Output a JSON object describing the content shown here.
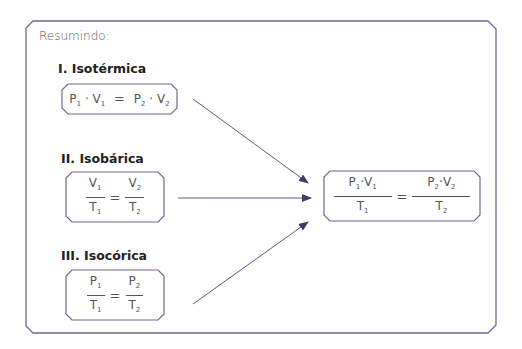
{
  "title": "Resumindo:",
  "colors": {
    "frame": "#5b5b85",
    "arrow": "#3d3d66",
    "text": "#555555"
  },
  "laws": [
    {
      "label": "I. Isotérmica",
      "formula": "P₁ · V₁ = P₂ · V₂",
      "left": "P",
      "left_sub": "1",
      "left2": "V",
      "left2_sub": "1",
      "right": "P",
      "right_sub": "2",
      "right2": "V",
      "right2_sub": "2"
    },
    {
      "label": "II. Isobárica",
      "formula": "V₁/T₁ = V₂/T₂",
      "num1": "V",
      "num1_sub": "1",
      "den1": "T",
      "den1_sub": "1",
      "num2": "V",
      "num2_sub": "2",
      "den2": "T",
      "den2_sub": "2"
    },
    {
      "label": "III. Isocórica",
      "formula": "P₁/T₁ = P₂/T₂",
      "num1": "P",
      "num1_sub": "1",
      "den1": "T",
      "den1_sub": "1",
      "num2": "P",
      "num2_sub": "2",
      "den2": "T",
      "den2_sub": "2"
    }
  ],
  "combined": {
    "formula": "P₁·V₁/T₁ = P₂·V₂/T₂",
    "num1": "P",
    "num1_sub": "1",
    "num1b": "V",
    "num1b_sub": "1",
    "den1": "T",
    "den1_sub": "1",
    "num2": "P",
    "num2_sub": "2",
    "num2b": "V",
    "num2b_sub": "2",
    "den2": "T",
    "den2_sub": "2"
  },
  "operators": {
    "equals": "=",
    "dot": "·"
  }
}
